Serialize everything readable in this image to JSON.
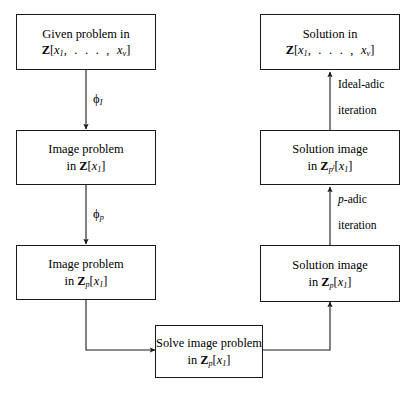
{
  "diagram": {
    "stroke_color": "#1a1a1a",
    "background_color": "#ffffff",
    "nodes": [
      {
        "id": "given-problem",
        "line1": "Given problem in",
        "line2_parts": {
          "ring": "Z",
          "open": "[",
          "var1": "x",
          "sub1": "1",
          "sep": ", . . . , ",
          "var2": "x",
          "sub2": "v",
          "close": "]"
        }
      },
      {
        "id": "solution-top",
        "line1": "Solution in",
        "line2_parts": {
          "ring": "Z",
          "open": "[",
          "var1": "x",
          "sub1": "1",
          "sep": ", . . . , ",
          "var2": "x",
          "sub2": "v",
          "close": "]"
        }
      },
      {
        "id": "image-problem-z",
        "line1": "Image problem",
        "line2_prefix": "in ",
        "line2_parts": {
          "ring": "Z",
          "ring_sub": "",
          "ring_sup": "",
          "open": "[",
          "var1": "x",
          "sub1": "1",
          "close": "]"
        }
      },
      {
        "id": "solution-image-zpi",
        "line1": "Solution image",
        "line2_prefix": "in ",
        "line2_parts": {
          "ring": "Z",
          "ring_sub": "p",
          "ring_sup": "I",
          "open": "[",
          "var1": "x",
          "sub1": "1",
          "close": "]"
        }
      },
      {
        "id": "image-problem-zp",
        "line1": "Image problem",
        "line2_prefix": "in ",
        "line2_parts": {
          "ring": "Z",
          "ring_sub": "p",
          "ring_sup": "",
          "open": "[",
          "var1": "x",
          "sub1": "1",
          "close": "]"
        }
      },
      {
        "id": "solution-image-zp",
        "line1": "Solution image",
        "line2_prefix": "in ",
        "line2_parts": {
          "ring": "Z",
          "ring_sub": "p",
          "ring_sup": "",
          "open": "[",
          "var1": "x",
          "sub1": "1",
          "close": "]"
        }
      },
      {
        "id": "solve-image-problem",
        "line1": "Solve image problem",
        "line2_prefix": "in ",
        "line2_parts": {
          "ring": "Z",
          "ring_sub": "p",
          "ring_sup": "",
          "open": "[",
          "var1": "x",
          "sub1": "1",
          "close": "]"
        }
      }
    ],
    "edge_labels": {
      "phi_ideal": {
        "symbol": "ϕ",
        "subscript": "I"
      },
      "phi_p": {
        "symbol": "ϕ",
        "subscript": "p"
      },
      "ideal_adic_line1": "Ideal-adic",
      "ideal_adic_line2": "iteration",
      "p_adic_prefix": "p",
      "p_adic_suffix": "-adic",
      "p_adic_line2": "iteration"
    }
  }
}
